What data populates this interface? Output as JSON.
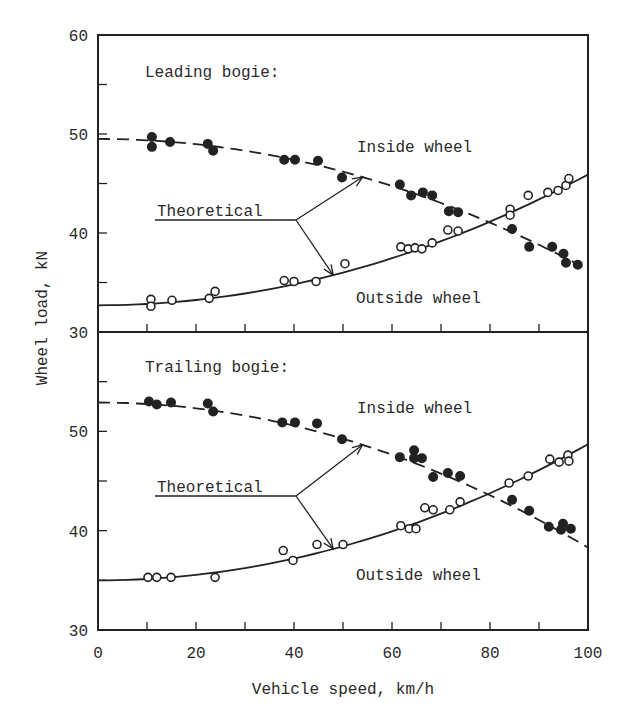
{
  "chart_data": {
    "type": "scatter",
    "xlabel": "Vehicle speed, km/h",
    "ylabel": "Wheel load, kN",
    "x_ticks": [
      0,
      20,
      40,
      60,
      80,
      100
    ],
    "x_minor_step": 10,
    "xlim": [
      0,
      100
    ],
    "grid": false,
    "panels": [
      {
        "title": "Leading bogie:",
        "ylim": [
          30,
          60
        ],
        "y_ticks": [
          30,
          40,
          50,
          60
        ],
        "annotation": "Theoretical",
        "series": [
          {
            "name": "Inside wheel",
            "marker": "filled-circle",
            "points": [
              [
                11,
                49.7
              ],
              [
                11,
                48.7
              ],
              [
                14.7,
                49.2
              ],
              [
                22.4,
                49.0
              ],
              [
                23.5,
                48.3
              ],
              [
                38,
                47.4
              ],
              [
                40.2,
                47.4
              ],
              [
                44.9,
                47.3
              ],
              [
                49.8,
                45.6
              ],
              [
                61.6,
                44.9
              ],
              [
                63.9,
                43.8
              ],
              [
                66.3,
                44.1
              ],
              [
                68.2,
                43.8
              ],
              [
                71.6,
                42.2
              ],
              [
                73.5,
                42.1
              ],
              [
                84.5,
                40.4
              ],
              [
                88,
                38.6
              ],
              [
                92.7,
                38.6
              ],
              [
                95,
                37.9
              ],
              [
                95.5,
                37.0
              ],
              [
                97.9,
                36.8
              ]
            ],
            "theoretical": {
              "style": "dashed",
              "a": 49.5,
              "b": -13.2
            }
          },
          {
            "name": "Outside wheel",
            "marker": "open-circle",
            "points": [
              [
                10.8,
                33.3
              ],
              [
                10.8,
                32.6
              ],
              [
                15.1,
                33.2
              ],
              [
                22.7,
                33.4
              ],
              [
                23.9,
                34.1
              ],
              [
                38,
                35.2
              ],
              [
                40,
                35.1
              ],
              [
                44.5,
                35.1
              ],
              [
                50.4,
                36.9
              ],
              [
                61.8,
                38.6
              ],
              [
                63.3,
                38.4
              ],
              [
                64.7,
                38.5
              ],
              [
                66.1,
                38.4
              ],
              [
                68.2,
                39.0
              ],
              [
                71.4,
                40.3
              ],
              [
                73.5,
                40.2
              ],
              [
                84.1,
                42.4
              ],
              [
                84.1,
                41.8
              ],
              [
                87.8,
                43.8
              ],
              [
                91.8,
                44.1
              ],
              [
                93.9,
                44.3
              ],
              [
                95.5,
                44.8
              ],
              [
                96.1,
                45.5
              ]
            ],
            "theoretical": {
              "style": "solid",
              "a": 32.7,
              "b": 13.2
            }
          }
        ],
        "labels": {
          "inside": "Inside wheel",
          "outside": "Outside wheel"
        }
      },
      {
        "title": "Trailing bogie:",
        "ylim": [
          30,
          60
        ],
        "y_ticks": [
          30,
          40,
          50
        ],
        "annotation": "Theoretical",
        "series": [
          {
            "name": "Inside wheel",
            "marker": "filled-circle",
            "points": [
              [
                10.4,
                53.0
              ],
              [
                12,
                52.7
              ],
              [
                14.9,
                52.9
              ],
              [
                22.4,
                52.8
              ],
              [
                23.5,
                52.0
              ],
              [
                37.6,
                50.9
              ],
              [
                40.2,
                50.9
              ],
              [
                44.7,
                50.8
              ],
              [
                49.8,
                49.2
              ],
              [
                61.6,
                47.4
              ],
              [
                64.5,
                48.1
              ],
              [
                64.5,
                47.3
              ],
              [
                66.1,
                47.3
              ],
              [
                68.4,
                45.4
              ],
              [
                71.4,
                45.8
              ],
              [
                73.9,
                45.5
              ],
              [
                84.5,
                43.1
              ],
              [
                88,
                42.0
              ],
              [
                92,
                40.4
              ],
              [
                94.5,
                40.1
              ],
              [
                94.9,
                40.7
              ],
              [
                96.5,
                40.2
              ]
            ],
            "theoretical": {
              "style": "dashed",
              "a": 52.9,
              "b": -14.6
            }
          },
          {
            "name": "Outside wheel",
            "marker": "open-circle",
            "points": [
              [
                10.2,
                35.3
              ],
              [
                12,
                35.3
              ],
              [
                14.9,
                35.3
              ],
              [
                23.9,
                35.3
              ],
              [
                37.8,
                38.0
              ],
              [
                39.8,
                37.0
              ],
              [
                44.7,
                38.6
              ],
              [
                50,
                38.6
              ],
              [
                61.8,
                40.5
              ],
              [
                63.5,
                40.2
              ],
              [
                64.9,
                40.2
              ],
              [
                66.7,
                42.3
              ],
              [
                68.4,
                42.1
              ],
              [
                71.8,
                42.1
              ],
              [
                73.9,
                42.9
              ],
              [
                83.9,
                44.8
              ],
              [
                87.8,
                45.5
              ],
              [
                92.2,
                47.2
              ],
              [
                94.1,
                46.9
              ],
              [
                95.9,
                47.6
              ],
              [
                96.1,
                47.0
              ]
            ],
            "theoretical": {
              "style": "solid",
              "a": 35.0,
              "b": 13.7
            }
          }
        ],
        "labels": {
          "inside": "Inside wheel",
          "outside": "Outside wheel"
        }
      }
    ]
  },
  "colors": {
    "ink": "#222222",
    "background": "#ffffff"
  }
}
